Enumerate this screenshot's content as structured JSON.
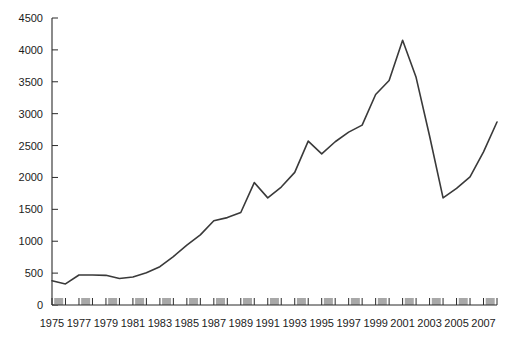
{
  "chart_data": {
    "type": "line",
    "title": "",
    "subtitle": "",
    "xlabel": "",
    "ylabel": "",
    "xlim": [
      1975,
      2008
    ],
    "ylim": [
      0,
      4500
    ],
    "grid": false,
    "legend": false,
    "legend_position": "none",
    "y_ticks": [
      0,
      500,
      1000,
      1500,
      2000,
      2500,
      3000,
      3500,
      4000,
      4500
    ],
    "y_tick_labels": [
      "0",
      "500",
      "1000",
      "1500",
      "2000",
      "2500",
      "3000",
      "3500",
      "4000",
      "4500"
    ],
    "x_ticks": [
      1975,
      1977,
      1979,
      1981,
      1983,
      1985,
      1987,
      1989,
      1991,
      1993,
      1995,
      1997,
      1999,
      2001,
      2003,
      2005,
      2007
    ],
    "x_tick_labels": [
      "1975",
      "1977",
      "1979",
      "1981",
      "1983",
      "1985",
      "1987",
      "1989",
      "1991",
      "1993",
      "1995",
      "1997",
      "1999",
      "2001",
      "2003",
      "2005",
      "2007"
    ],
    "x": [
      1975,
      1976,
      1977,
      1978,
      1979,
      1980,
      1981,
      1982,
      1983,
      1984,
      1985,
      1986,
      1987,
      1988,
      1989,
      1990,
      1991,
      1992,
      1993,
      1994,
      1995,
      1996,
      1997,
      1998,
      1999,
      2000,
      2001,
      2002,
      2003,
      2004,
      2005,
      2006,
      2007,
      2008
    ],
    "values": [
      380,
      330,
      470,
      470,
      465,
      415,
      440,
      505,
      600,
      760,
      940,
      1100,
      1320,
      1370,
      1450,
      1920,
      1680,
      1850,
      2080,
      2570,
      2370,
      2560,
      2710,
      2820,
      3300,
      3520,
      4150,
      3570,
      2650,
      1680,
      1830,
      2010,
      2400,
      2870
    ],
    "series": [
      {
        "name": "series-1",
        "color": "#3a3a3a",
        "values": [
          380,
          330,
          470,
          470,
          465,
          415,
          440,
          505,
          600,
          760,
          940,
          1100,
          1320,
          1370,
          1450,
          1920,
          1680,
          1850,
          2080,
          2570,
          2370,
          2560,
          2710,
          2820,
          3300,
          3520,
          4150,
          3570,
          2650,
          1680,
          1830,
          2010,
          2400,
          2870
        ]
      }
    ],
    "annotations": {
      "peak_year": 1999,
      "peak_value": 4150,
      "trough_year": 2002,
      "trough_value": 1680,
      "secondary_peak_year": 2006,
      "secondary_peak_value": 2870,
      "final_year": 2008,
      "final_value": 1630
    },
    "axis_band_color": "#a8a8a8",
    "line_color": "#3a3a3a"
  }
}
